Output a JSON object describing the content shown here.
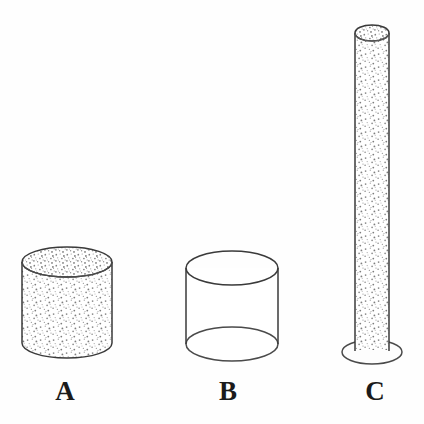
{
  "figure": {
    "background_color": "#fefefe",
    "outline_color": "#3a3a3a",
    "stipple_color": "#8a8a8a",
    "label_color": "#1b1b1b",
    "width": 424,
    "height": 424
  },
  "cylinders": [
    {
      "id": "A",
      "label": "A",
      "fill_state": "filled",
      "fill_pattern": "stipple",
      "shape": "short-wide-cylinder",
      "has_base_stand": false,
      "bottom_style": "rounded-opaque",
      "geometry": {
        "center_x": 67,
        "top_y": 262,
        "bottom_y": 358,
        "radius_x": 45,
        "radius_y": 15,
        "body_height": 81
      }
    },
    {
      "id": "B",
      "label": "B",
      "fill_state": "empty",
      "fill_pattern": "none",
      "shape": "short-wide-cylinder",
      "has_base_stand": false,
      "bottom_style": "full-ellipse-transparent",
      "geometry": {
        "center_x": 232,
        "top_y": 268,
        "bottom_y": 344,
        "radius_x": 46,
        "radius_y": 17,
        "body_height": 76
      }
    },
    {
      "id": "C",
      "label": "C",
      "fill_state": "filled",
      "fill_pattern": "stipple",
      "shape": "tall-narrow-tube",
      "has_base_stand": true,
      "bottom_style": "flared-foot-ellipse",
      "geometry": {
        "center_x": 372,
        "top_y": 33,
        "bottom_y": 350,
        "radius_x": 17,
        "radius_y": 8,
        "body_height": 317,
        "base_radius_x": 30,
        "base_radius_y": 12,
        "base_center_y": 352
      }
    }
  ],
  "labels": {
    "a": "A",
    "b": "B",
    "c": "C"
  }
}
